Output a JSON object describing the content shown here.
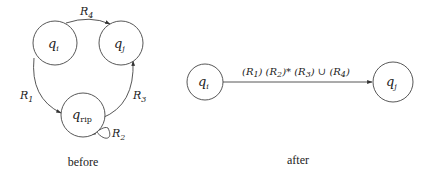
{
  "before": {
    "caption": "before",
    "states": {
      "qi": {
        "name": "q",
        "sub": "i"
      },
      "qj": {
        "name": "q",
        "sub": "j"
      },
      "qrip": {
        "name": "q",
        "sub": "rip"
      }
    },
    "edges": {
      "r4": {
        "name": "R",
        "sub": "4",
        "from": "qi",
        "to": "qj"
      },
      "r1": {
        "name": "R",
        "sub": "1",
        "from": "qi",
        "to": "qrip"
      },
      "r3": {
        "name": "R",
        "sub": "3",
        "from": "qrip",
        "to": "qj"
      },
      "r2": {
        "name": "R",
        "sub": "2",
        "from": "qrip",
        "to": "qrip"
      }
    }
  },
  "after": {
    "caption": "after",
    "states": {
      "qi": {
        "name": "q",
        "sub": "i"
      },
      "qj": {
        "name": "q",
        "sub": "j"
      }
    },
    "edge": {
      "from": "qi",
      "to": "qj",
      "label": {
        "p1_open": "(R",
        "p1_sub": "1",
        "p1_close": ") (R",
        "p2_sub": "2",
        "p2_close": ")* (R",
        "p3_sub": "3",
        "p3_close": ") ∪ (R",
        "p4_sub": "4",
        "p4_close": ")"
      }
    }
  },
  "colors": {
    "stroke": "#444444",
    "text": "#222222",
    "background": "#ffffff"
  }
}
